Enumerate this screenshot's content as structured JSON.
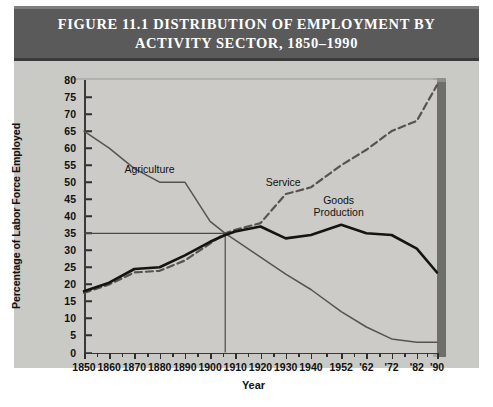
{
  "figure": {
    "title_line1": "FIGURE 11.1   DISTRIBUTION OF EMPLOYMENT BY",
    "title_line2": "ACTIVITY SECTOR, 1850–1990",
    "title_bar_color": "#5a5a5a",
    "panel_color": "#c9c9c6",
    "plot_bg_color": "#cccbc8"
  },
  "chart_data": {
    "type": "line",
    "title": "FIGURE 11.1 DISTRIBUTION OF EMPLOYMENT BY ACTIVITY SECTOR, 1850–1990",
    "xlabel": "Year",
    "ylabel": "Percentage of Labor Force Employed",
    "xlim": [
      1850,
      1990
    ],
    "ylim": [
      0,
      80
    ],
    "grid": false,
    "legend": "inline-annotations",
    "y_ticks": [
      0,
      5,
      10,
      15,
      20,
      25,
      30,
      35,
      40,
      45,
      50,
      55,
      60,
      65,
      70,
      75,
      80
    ],
    "x_ticks": [
      1850,
      1860,
      1870,
      1880,
      1890,
      1900,
      1910,
      1920,
      1930,
      1940,
      1952,
      1962,
      1972,
      1982,
      1990
    ],
    "x_tick_labels": [
      "1850",
      "1860",
      "1870",
      "1880",
      "1890",
      "1900",
      "1910",
      "1920",
      "1930",
      "1940",
      "1952",
      "'62",
      "'72",
      "'82",
      "'90"
    ],
    "x_minor_ticks": [
      1855,
      1865,
      1875,
      1885,
      1895,
      1905,
      1915,
      1925,
      1935,
      1946,
      1957,
      1967,
      1977,
      1986
    ],
    "annotations": [
      {
        "text": "Agriculture",
        "x": 1876,
        "y": 54,
        "series": "Agriculture"
      },
      {
        "text": "Service",
        "x": 1929,
        "y": 50,
        "series": "Service"
      },
      {
        "text": "Goods\nProduction",
        "x": 1951,
        "y": 43,
        "series": "Goods Production"
      },
      {
        "text": "crosshair at 35% ≈ 1906",
        "x": 1906,
        "y": 35,
        "series": "crossover-marker"
      }
    ],
    "crosshair": {
      "x": 1906,
      "y": 35,
      "color": "#4a4a48"
    },
    "series": [
      {
        "name": "Agriculture",
        "style": "solid-thin",
        "color": "#55544f",
        "x": [
          1850,
          1860,
          1870,
          1880,
          1890,
          1900,
          1906,
          1910,
          1920,
          1930,
          1940,
          1952,
          1962,
          1972,
          1982,
          1990
        ],
        "values": [
          65,
          60,
          54,
          50,
          50,
          38.5,
          35,
          33,
          28,
          23,
          18.5,
          12,
          7.5,
          4,
          3,
          3
        ]
      },
      {
        "name": "Service",
        "style": "dashed",
        "color": "#55544f",
        "x": [
          1850,
          1860,
          1870,
          1880,
          1890,
          1900,
          1906,
          1910,
          1920,
          1930,
          1940,
          1952,
          1962,
          1972,
          1982,
          1990
        ],
        "values": [
          17.5,
          20,
          23.5,
          24,
          27,
          32,
          35,
          36,
          38,
          46.5,
          48.5,
          55,
          59.5,
          65,
          68,
          78.5
        ]
      },
      {
        "name": "Goods Production",
        "style": "solid-thick",
        "color": "#15150f",
        "x": [
          1850,
          1860,
          1870,
          1880,
          1890,
          1900,
          1906,
          1910,
          1920,
          1930,
          1940,
          1952,
          1962,
          1972,
          1982,
          1990
        ],
        "values": [
          18,
          20.5,
          24.5,
          25,
          28.5,
          32.5,
          34.5,
          35.5,
          37,
          33.5,
          34.5,
          37.5,
          35,
          34.5,
          30.5,
          23.5
        ]
      }
    ]
  }
}
